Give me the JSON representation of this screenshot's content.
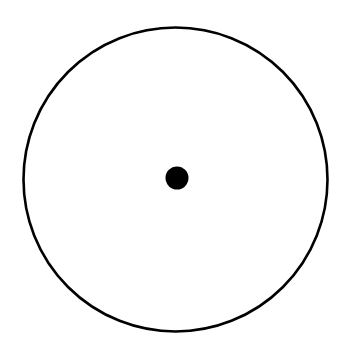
{
  "diagram": {
    "canvas": {
      "width": 346,
      "height": 348,
      "background": "#ffffff"
    },
    "circle": {
      "cx": 175.5,
      "cy": 179.5,
      "r": 152,
      "stroke": "#000000",
      "stroke_width": 2.6,
      "fill": "none"
    },
    "center_dot": {
      "cx": 177,
      "cy": 178,
      "r": 11.5,
      "fill": "#000000"
    }
  }
}
